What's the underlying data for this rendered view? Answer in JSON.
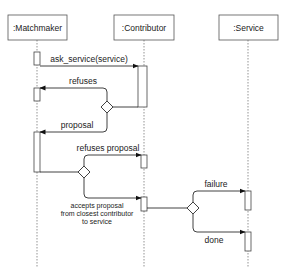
{
  "diagram": {
    "type": "sequence",
    "participants": [
      {
        "id": "matchmaker",
        "label": ":Matchmaker"
      },
      {
        "id": "contributor",
        "label": ":Contributor"
      },
      {
        "id": "service",
        "label": ":Service"
      }
    ],
    "messages": [
      {
        "id": "m1",
        "label": "ask_service(service)",
        "from": "matchmaker",
        "to": "contributor"
      },
      {
        "id": "m2",
        "label": "refuses",
        "from": "contributor",
        "to": "matchmaker",
        "via": "decision-1"
      },
      {
        "id": "m3",
        "label": "proposal",
        "from": "contributor",
        "to": "matchmaker",
        "via": "decision-1"
      },
      {
        "id": "m4",
        "label": "refuses proposal",
        "from": "matchmaker",
        "to": "contributor",
        "via": "decision-2"
      },
      {
        "id": "m5",
        "label_lines": [
          "accepts proposal",
          "from closest contributor",
          "to service"
        ],
        "from": "matchmaker",
        "to": "contributor",
        "via": "decision-2"
      },
      {
        "id": "m6",
        "label": "failure",
        "from": "contributor",
        "to": "service",
        "via": "decision-3"
      },
      {
        "id": "m7",
        "label": "done",
        "from": "contributor",
        "to": "service",
        "via": "decision-3"
      }
    ],
    "decisions": [
      "decision-1",
      "decision-2",
      "decision-3"
    ]
  }
}
